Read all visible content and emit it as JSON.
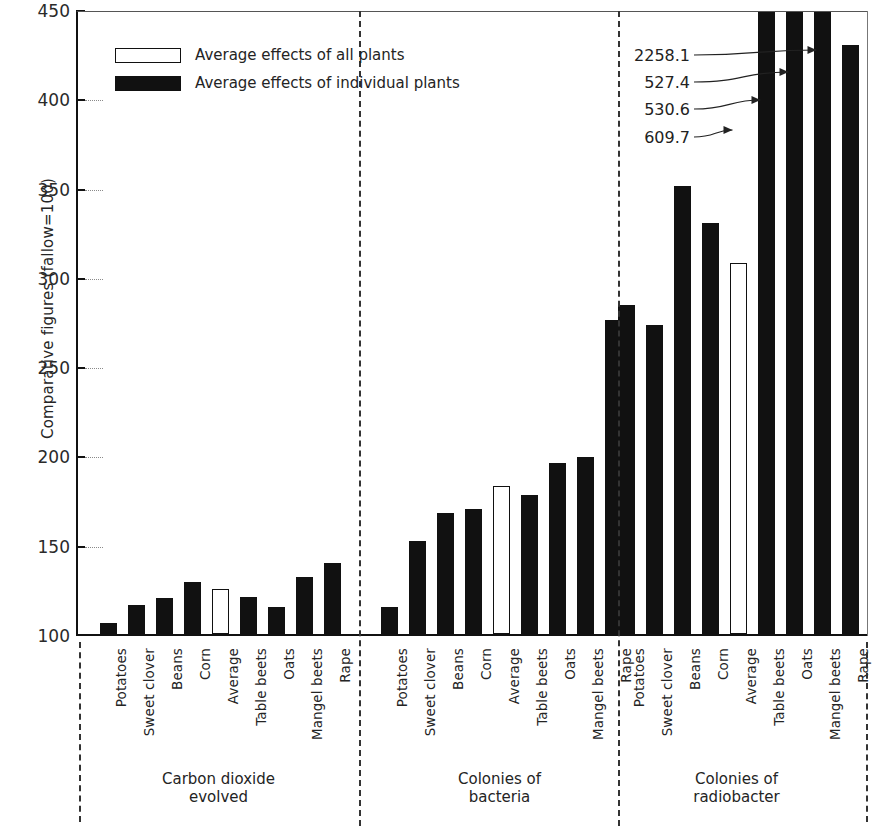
{
  "chart_data": {
    "type": "bar",
    "title": "",
    "xlabel": "",
    "ylabel": "Comparative figures (fallow=100)",
    "ylim": [
      100,
      450
    ],
    "yticks": [
      100,
      150,
      200,
      250,
      300,
      350,
      400,
      450
    ],
    "ytick_labels": [
      "100",
      "150",
      "200",
      "250",
      "300",
      "350",
      "400",
      "450"
    ],
    "grid": false,
    "legend": {
      "position": "upper-left",
      "entries": [
        {
          "label": "Average effects of all plants",
          "style": "open"
        },
        {
          "label": "Average effects of individual plants",
          "style": "filled"
        }
      ]
    },
    "categories": [
      "Potatoes",
      "Sweet clover",
      "Beans",
      "Corn",
      "Average",
      "Table beets",
      "Oats",
      "Mangel beets",
      "Rape"
    ],
    "groups": [
      {
        "name": "Carbon dioxide evolved",
        "title_lines": [
          "Carbon dioxide",
          "evolved"
        ],
        "bars": [
          {
            "label": "Potatoes",
            "value": 106,
            "style": "filled",
            "clipped": false
          },
          {
            "label": "Sweet clover",
            "value": 116,
            "style": "filled",
            "clipped": false
          },
          {
            "label": "Beans",
            "value": 120,
            "style": "filled",
            "clipped": false
          },
          {
            "label": "Corn",
            "value": 129,
            "style": "filled",
            "clipped": false
          },
          {
            "label": "Average",
            "value": 125,
            "style": "open",
            "clipped": false
          },
          {
            "label": "Table beets",
            "value": 121,
            "style": "filled",
            "clipped": false
          },
          {
            "label": "Oats",
            "value": 115,
            "style": "filled",
            "clipped": false
          },
          {
            "label": "Mangel beets",
            "value": 132,
            "style": "filled",
            "clipped": false
          },
          {
            "label": "Rape",
            "value": 140,
            "style": "filled",
            "clipped": false
          }
        ]
      },
      {
        "name": "Colonies of bacteria",
        "title_lines": [
          "Colonies of",
          "bacteria"
        ],
        "bars": [
          {
            "label": "Potatoes",
            "value": 115,
            "style": "filled",
            "clipped": false
          },
          {
            "label": "Sweet clover",
            "value": 152,
            "style": "filled",
            "clipped": false
          },
          {
            "label": "Beans",
            "value": 168,
            "style": "filled",
            "clipped": false
          },
          {
            "label": "Corn",
            "value": 170,
            "style": "filled",
            "clipped": false
          },
          {
            "label": "Average",
            "value": 183,
            "style": "open",
            "clipped": false
          },
          {
            "label": "Table beets",
            "value": 178,
            "style": "filled",
            "clipped": false
          },
          {
            "label": "Oats",
            "value": 196,
            "style": "filled",
            "clipped": false
          },
          {
            "label": "Mangel beets",
            "value": 199,
            "style": "filled",
            "clipped": false
          },
          {
            "label": "Rape",
            "value": 276,
            "style": "filled",
            "clipped": false
          }
        ]
      },
      {
        "name": "Colonies of radiobacter",
        "title_lines": [
          "Colonies of",
          "radiobacter"
        ],
        "bars": [
          {
            "label": "Potatoes",
            "value": 284,
            "style": "filled",
            "clipped": false
          },
          {
            "label": "Sweet clover",
            "value": 273,
            "style": "filled",
            "clipped": false
          },
          {
            "label": "Beans",
            "value": 351,
            "style": "filled",
            "clipped": false
          },
          {
            "label": "Corn",
            "value": 330,
            "style": "filled",
            "clipped": false
          },
          {
            "label": "Average",
            "value": 609.7,
            "style": "open",
            "clipped": true,
            "drawn_to": 308
          },
          {
            "label": "Table beets",
            "value": 530.6,
            "style": "filled",
            "clipped": true,
            "drawn_to": 450
          },
          {
            "label": "Oats",
            "value": 527.4,
            "style": "filled",
            "clipped": true,
            "drawn_to": 450
          },
          {
            "label": "Mangel beets",
            "value": 2258.1,
            "style": "filled",
            "clipped": true,
            "drawn_to": 450
          },
          {
            "label": "Rape",
            "value": 430,
            "style": "filled",
            "clipped": false
          }
        ]
      }
    ],
    "annotations": [
      {
        "text": "2258.1",
        "target_group": "Colonies of radiobacter",
        "target_bar": "Mangel beets"
      },
      {
        "text": "527.4",
        "target_group": "Colonies of radiobacter",
        "target_bar": "Oats"
      },
      {
        "text": "530.6",
        "target_group": "Colonies of radiobacter",
        "target_bar": "Table beets"
      },
      {
        "text": "609.7",
        "target_group": "Colonies of radiobacter",
        "target_bar": "Average"
      }
    ],
    "colors": {
      "filled_bar": "#111111",
      "open_bar": "#ffffff",
      "axis": "#111111",
      "background": "#ffffff"
    }
  }
}
